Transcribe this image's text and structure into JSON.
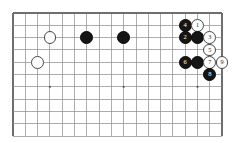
{
  "diagram": {
    "kind": "go-board-diagram",
    "board": {
      "left": 13,
      "top": 13,
      "spacing": 12.3,
      "cols": 17,
      "rows": 10,
      "line_color": "#8a8a8a",
      "border_color": "#6e6e6e",
      "star_color": "#5a5a5a",
      "star_points": [
        [
          3,
          6
        ],
        [
          9,
          6
        ],
        [
          15,
          6
        ]
      ],
      "bottom_cut": true
    },
    "stones": [
      {
        "col": 3,
        "row": 2,
        "color": "white",
        "label": ""
      },
      {
        "col": 2,
        "row": 4,
        "color": "white",
        "label": ""
      },
      {
        "col": 6,
        "row": 2,
        "color": "black",
        "label": ""
      },
      {
        "col": 9,
        "row": 2,
        "color": "black",
        "label": ""
      },
      {
        "col": 14,
        "row": 1,
        "color": "black",
        "label": "4"
      },
      {
        "col": 15,
        "row": 1,
        "color": "white",
        "label": "1"
      },
      {
        "col": 14,
        "row": 2,
        "color": "black",
        "label": "2"
      },
      {
        "col": 15,
        "row": 2,
        "color": "black",
        "label": ""
      },
      {
        "col": 16,
        "row": 2,
        "color": "white",
        "label": "3"
      },
      {
        "col": 16,
        "row": 3,
        "color": "white",
        "label": "5"
      },
      {
        "col": 14,
        "row": 4,
        "color": "black",
        "label": "6"
      },
      {
        "col": 15,
        "row": 4,
        "color": "black",
        "label": ""
      },
      {
        "col": 16,
        "row": 4,
        "color": "white",
        "label": "7"
      },
      {
        "col": 17,
        "row": 4,
        "color": "white",
        "label": "9"
      },
      {
        "col": 16,
        "row": 5,
        "color": "black",
        "label": "8"
      }
    ],
    "chart_data": {
      "type": "table",
      "title": "",
      "move_sequence": [
        {
          "move": 1,
          "color": "white",
          "col": 15,
          "row": 1
        },
        {
          "move": 2,
          "color": "black",
          "col": 14,
          "row": 2
        },
        {
          "move": 3,
          "color": "white",
          "col": 16,
          "row": 2
        },
        {
          "move": 4,
          "color": "black",
          "col": 14,
          "row": 1
        },
        {
          "move": 5,
          "color": "white",
          "col": 16,
          "row": 3
        },
        {
          "move": 6,
          "color": "black",
          "col": 14,
          "row": 4
        },
        {
          "move": 7,
          "color": "white",
          "col": 16,
          "row": 4
        },
        {
          "move": 8,
          "color": "black",
          "col": 16,
          "row": 5
        },
        {
          "move": 9,
          "color": "white",
          "col": 17,
          "row": 4
        }
      ],
      "unnumbered_stones": [
        {
          "color": "white",
          "col": 3,
          "row": 2
        },
        {
          "color": "white",
          "col": 2,
          "row": 4
        },
        {
          "color": "black",
          "col": 6,
          "row": 2
        },
        {
          "color": "black",
          "col": 9,
          "row": 2
        },
        {
          "color": "black",
          "col": 15,
          "row": 2
        },
        {
          "color": "black",
          "col": 15,
          "row": 4
        }
      ]
    }
  }
}
